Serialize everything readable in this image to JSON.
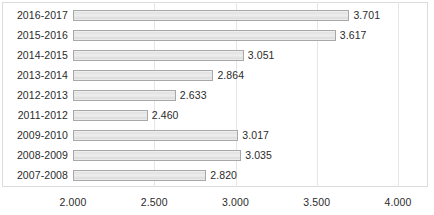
{
  "chart_data": {
    "type": "bar",
    "orientation": "horizontal",
    "title": "",
    "subtitle": "",
    "xlabel": "",
    "ylabel": "",
    "categories": [
      "2016-2017",
      "2015-2016",
      "2014-2015",
      "2013-2014",
      "2012-2013",
      "2011-2012",
      "2009-2010",
      "2008-2009",
      "2007-2008"
    ],
    "values": [
      3.701,
      3.617,
      3.051,
      2.864,
      2.633,
      2.46,
      3.017,
      3.035,
      2.82
    ],
    "value_labels": [
      "3.701",
      "3.617",
      "3.051",
      "2.864",
      "2.633",
      "2.460",
      "3.017",
      "3.035",
      "2.820"
    ],
    "xlim": [
      2.0,
      4.0
    ],
    "xticks": [
      2.0,
      2.5,
      3.0,
      3.5,
      4.0
    ],
    "xtick_labels": [
      "2.000",
      "2.500",
      "3.000",
      "3.500",
      "4.000"
    ],
    "grid": true,
    "grid_axis": "x",
    "legend": false,
    "legend_position": "none",
    "bar_fill_color": "#e9e9e9",
    "bar_border_color": "#a8a8a8",
    "text_color": "#2b2b2b",
    "background_color": "#ffffff",
    "gridline_color": "#e6e6e6",
    "frame_color": "#dcdcdc"
  }
}
